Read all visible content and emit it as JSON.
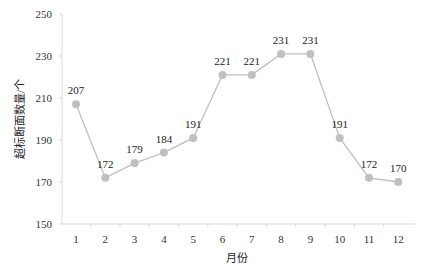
{
  "chart_data": {
    "type": "line",
    "title": "",
    "xlabel": "月份",
    "ylabel": "超标断面数量/个",
    "categories": [
      "1",
      "2",
      "3",
      "4",
      "5",
      "6",
      "7",
      "8",
      "9",
      "10",
      "11",
      "12"
    ],
    "series": [
      {
        "name": "超标断面数量",
        "values": [
          207,
          172,
          179,
          184,
          191,
          221,
          221,
          231,
          231,
          191,
          172,
          170
        ],
        "color": "#c0c0c0"
      }
    ],
    "ylim": [
      150,
      250
    ],
    "yticks": [
      150,
      170,
      190,
      210,
      230,
      250
    ],
    "grid": false,
    "legend": "none",
    "data_labels": true
  }
}
